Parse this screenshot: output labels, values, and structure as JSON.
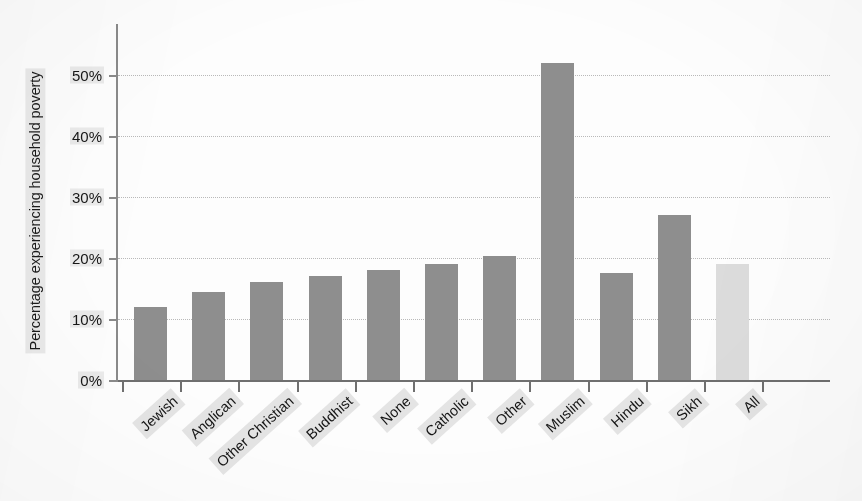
{
  "chart_data": {
    "type": "bar",
    "title": "",
    "xlabel": "",
    "ylabel": "Percentage experiencing household poverty",
    "ylim": [
      0,
      55
    ],
    "grid": true,
    "legend": "none",
    "ytick_labels": [
      "0%",
      "10%",
      "20%",
      "30%",
      "40%",
      "50%"
    ],
    "ytick_values": [
      0,
      10,
      20,
      30,
      40,
      50
    ],
    "categories": [
      "Jewish",
      "Anglican",
      "Other Christian",
      "Buddhist",
      "None",
      "Catholic",
      "Other",
      "Muslim",
      "Hindu",
      "Sikh",
      "All"
    ],
    "values": [
      12,
      14.5,
      16,
      17,
      18,
      19,
      20.3,
      52,
      17.5,
      27,
      19
    ],
    "series": [
      {
        "name": "Percentage experiencing household poverty",
        "values": [
          12,
          14.5,
          16,
          17,
          18,
          19,
          20.3,
          52,
          17.5,
          27,
          19
        ]
      }
    ],
    "bar_colors": [
      "#8e8e8e",
      "#8e8e8e",
      "#8e8e8e",
      "#8e8e8e",
      "#8e8e8e",
      "#8e8e8e",
      "#8e8e8e",
      "#8e8e8e",
      "#8e8e8e",
      "#8e8e8e",
      "#dcdcdc"
    ],
    "highlight_note": "final 'All' bar drawn in a lighter grey than the religion bars",
    "colors": {
      "bar": "#8e8e8e",
      "bar_muted": "#dcdcdc",
      "axis": "#6f6f6f",
      "gridline": "#b9b9b9",
      "text": "#151515",
      "background": "#fdfdfd"
    }
  }
}
